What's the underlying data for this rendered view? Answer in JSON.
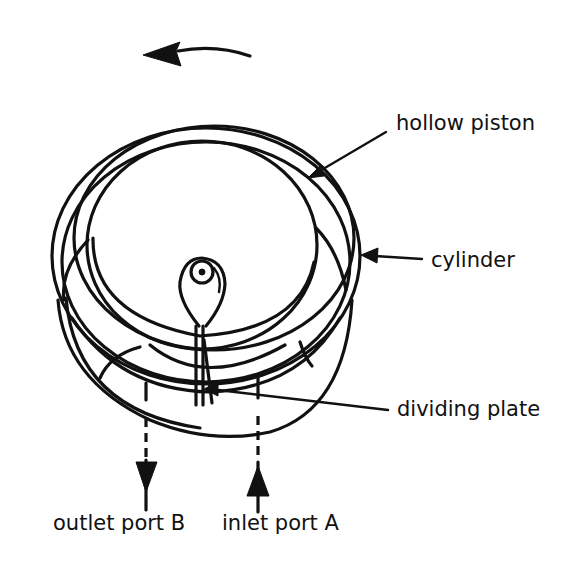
{
  "diagram": {
    "type": "rotary piston pump / meter cross-section",
    "rotation_direction": "counter-clockwise",
    "labels": {
      "hollow_piston": "hollow piston",
      "cylinder": "cylinder",
      "dividing_plate": "dividing plate",
      "outlet_port": "outlet port B",
      "inlet_port": "inlet port A"
    },
    "flow": {
      "outlet": "down (out of outlet port B)",
      "inlet": "up (into inlet port A)"
    },
    "colors": {
      "stroke": "#111111",
      "background": "#ffffff"
    }
  }
}
